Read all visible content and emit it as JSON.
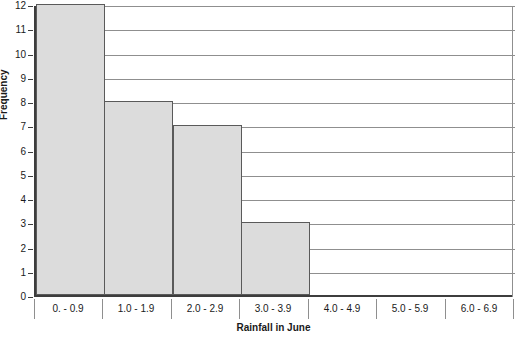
{
  "chart_data": {
    "type": "bar",
    "title": "",
    "xlabel": "Rainfall in June",
    "ylabel": "Frequency",
    "categories": [
      "0. - 0.9",
      "1.0 - 1.9",
      "2.0 - 2.9",
      "3.0 - 3.9",
      "4.0 - 4.9",
      "5.0 - 5.9",
      "6.0 - 6.9"
    ],
    "values": [
      12,
      8,
      7,
      3,
      0,
      0,
      0
    ],
    "ylim": [
      0,
      12
    ],
    "ytick_labels": [
      "0",
      "1",
      "2",
      "3",
      "4",
      "5",
      "6",
      "7",
      "8",
      "9",
      "10",
      "11",
      "12"
    ],
    "ytick_values": [
      0,
      1,
      2,
      3,
      4,
      5,
      6,
      7,
      8,
      9,
      10,
      11,
      12
    ],
    "grid": true,
    "legend": "none",
    "bar_fill_color": "#dcdcdc",
    "bar_border_color": "#5a5a5a",
    "gridline_color": "#8f8f8f",
    "axis_color": "#3d3d3d",
    "text_color": "#1a1a1a"
  }
}
